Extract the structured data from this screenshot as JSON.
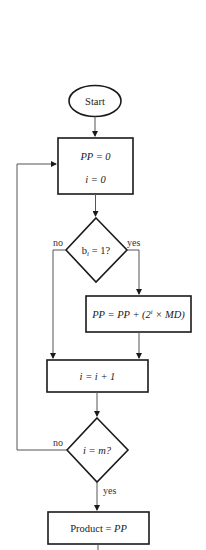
{
  "flowchart": {
    "start": {
      "label": "Start"
    },
    "init": {
      "line1": "PP = 0",
      "line2": "i = 0"
    },
    "decision_bit": {
      "label_pre": "b",
      "label_sub": "i",
      "label_post": " = 1?",
      "no": "no",
      "yes": "yes"
    },
    "accumulate": {
      "label_a": "PP = PP + (2",
      "label_sup": "i",
      "label_b": " × MD)"
    },
    "increment": {
      "label": "i = i + 1"
    },
    "decision_end": {
      "label": "i = m?",
      "no": "no",
      "yes": "yes"
    },
    "result": {
      "label_a": "Product = ",
      "label_b": "PP"
    }
  },
  "colors": {
    "stroke": "#1a1a1a",
    "connector": "#555555",
    "background": "#ffffff"
  }
}
